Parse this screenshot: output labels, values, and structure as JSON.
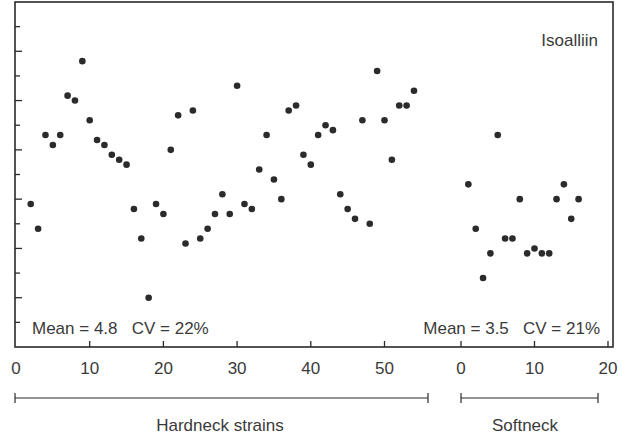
{
  "chart_data": {
    "type": "scatter",
    "title": "Isoalliin",
    "xlabel": "",
    "ylabel": "",
    "ylim": [
      1,
      8
    ],
    "y_major_ticks": [
      1,
      2,
      3,
      4,
      5,
      6,
      7,
      8
    ],
    "y_tick_labels_visible": false,
    "grid": false,
    "panels": [
      {
        "name": "Hardneck strains",
        "xlim": [
          0,
          56
        ],
        "x_ticks": [
          0,
          10,
          20,
          30,
          40,
          50
        ],
        "annotation": "Mean = 4.8   CV = 22%",
        "mean": 4.8,
        "cv_percent": 22,
        "x": [
          2,
          3,
          4,
          5,
          6,
          7,
          8,
          9,
          10,
          11,
          12,
          13,
          14,
          15,
          16,
          17,
          18,
          19,
          20,
          21,
          22,
          23,
          24,
          25,
          26,
          27,
          28,
          29,
          30,
          31,
          32,
          33,
          34,
          35,
          36,
          37,
          38,
          39,
          40,
          41,
          42,
          43,
          44,
          45,
          46,
          47,
          48,
          49,
          50,
          51,
          52,
          53,
          54
        ],
        "y": [
          3.9,
          3.4,
          5.3,
          5.1,
          5.3,
          6.1,
          6.0,
          6.8,
          5.6,
          5.2,
          5.1,
          4.9,
          4.8,
          4.7,
          3.8,
          3.2,
          2.0,
          3.9,
          3.7,
          5.0,
          5.7,
          3.1,
          5.8,
          3.2,
          3.4,
          3.7,
          4.1,
          3.7,
          6.3,
          3.9,
          3.8,
          4.6,
          5.3,
          4.4,
          4.0,
          5.8,
          5.9,
          4.9,
          4.7,
          5.3,
          5.5,
          5.4,
          4.1,
          3.8,
          3.6,
          5.6,
          3.5,
          6.6,
          5.6,
          4.8,
          5.9,
          5.9,
          6.2
        ]
      },
      {
        "name": "Softneck",
        "xlim": [
          0,
          20
        ],
        "x_ticks": [
          0,
          10,
          20
        ],
        "annotation": "Mean = 3.5   CV = 21%",
        "mean": 3.5,
        "cv_percent": 21,
        "x": [
          1,
          2,
          3,
          4,
          5,
          6,
          7,
          8,
          9,
          10,
          11,
          12,
          13,
          14,
          15,
          16
        ],
        "y": [
          4.3,
          3.4,
          2.4,
          2.9,
          5.3,
          3.2,
          3.2,
          4.0,
          2.9,
          3.0,
          2.9,
          2.9,
          4.0,
          4.3,
          3.6,
          4.0
        ]
      }
    ]
  },
  "labels": {
    "title": "Isoalliin",
    "hardneck_stats": "Mean = 4.8   CV = 22%",
    "softneck_stats": "Mean = 3.5   CV = 21%",
    "hardneck_group": "Hardneck strains",
    "softneck_group": "Softneck",
    "hardneck_ticks": [
      "0",
      "10",
      "20",
      "30",
      "40",
      "50"
    ],
    "softneck_ticks": [
      "0",
      "10",
      "20"
    ]
  },
  "colors": {
    "axis": "#2a2a2a",
    "point": "#2b2b2b",
    "text": "#3a3a3a",
    "background": "#ffffff"
  }
}
